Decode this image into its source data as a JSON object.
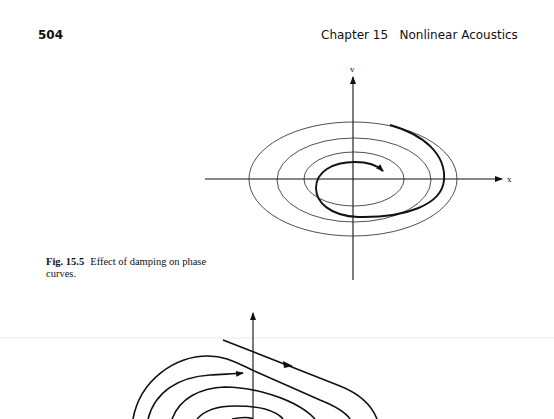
{
  "header": {
    "page_number": "504",
    "running_head": "Chapter 15   Nonlinear Acoustics"
  },
  "figure_15_5": {
    "label": "Fig. 15.5",
    "caption": "Effect of damping on phase curves.",
    "axes": {
      "x_label": "x",
      "y_label": "v"
    },
    "description": "Three concentric ellipses (undamped phase curves) with a thick inward spiral (damped trajectory) ending in an arrowhead"
  },
  "figure_lower": {
    "description": "Partially visible phase-plane figure: nested curves with arrows, vertical axis, a diagonal trajectory line with arrowhead"
  },
  "colors": {
    "ink": "#111111",
    "paper": "#ffffff"
  }
}
